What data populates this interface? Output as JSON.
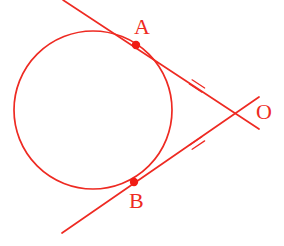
{
  "figure": {
    "domain": "Diagram",
    "width": 284,
    "height": 246,
    "background_color": "#ffffff",
    "stroke_color": "#ee2a22",
    "label_color": "#ee2a22",
    "point_fill_color": "#f01c14",
    "stroke_width": 1.7
  },
  "labels": {
    "point_a": "A",
    "point_b": "B",
    "point_o": "O"
  },
  "geometry": {
    "circle": {
      "name": "circle",
      "cx": 93,
      "cy": 110,
      "r": 79
    },
    "points": [
      {
        "id": "A",
        "label": "A",
        "x": 136,
        "y": 45,
        "role": "tangency-point",
        "radius": 4.2
      },
      {
        "id": "B",
        "label": "B",
        "x": 134,
        "y": 182,
        "role": "tangency-point",
        "radius": 4.2
      },
      {
        "id": "O",
        "label": "O",
        "x": 243,
        "y": 113,
        "role": "external-point",
        "radius": 0
      }
    ],
    "lines": [
      {
        "id": "tangent-a",
        "label": "tangent line through A and O",
        "x1": 63,
        "y1": 0,
        "x2": 259,
        "y2": 129
      },
      {
        "id": "tangent-b",
        "label": "tangent line through B and O",
        "x1": 62,
        "y1": 233,
        "x2": 259,
        "y2": 97
      }
    ],
    "tick_marks": [
      {
        "id": "tick-ao",
        "on_segment": "AO",
        "count": 2,
        "cx": 197,
        "cy": 86,
        "angle_deg": 33,
        "length": 15,
        "spacing": 5
      },
      {
        "id": "tick-bo",
        "on_segment": "BO",
        "count": 2,
        "cx": 197,
        "cy": 143,
        "angle_deg": -34,
        "length": 15,
        "spacing": 5
      }
    ],
    "label_positions": {
      "A": {
        "x": 134,
        "y": 16
      },
      "B": {
        "x": 129,
        "y": 190
      },
      "O": {
        "x": 256,
        "y": 101
      }
    }
  }
}
